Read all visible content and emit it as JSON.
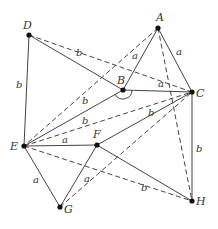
{
  "diagram": {
    "type": "geometry-figure",
    "colors": {
      "line": "#444444",
      "point": "#111111",
      "text": "#333333",
      "background": "#ffffff"
    },
    "points": [
      {
        "id": "A",
        "x": 158,
        "y": 28,
        "label": "A",
        "lx": 156,
        "ly": 21
      },
      {
        "id": "B",
        "x": 123,
        "y": 90,
        "label": "B",
        "lx": 117,
        "ly": 84
      },
      {
        "id": "C",
        "x": 192,
        "y": 92,
        "label": "C",
        "lx": 196,
        "ly": 97
      },
      {
        "id": "D",
        "x": 29,
        "y": 35,
        "label": "D",
        "lx": 23,
        "ly": 29
      },
      {
        "id": "E",
        "x": 24,
        "y": 146,
        "label": "E",
        "lx": 10,
        "ly": 150
      },
      {
        "id": "F",
        "x": 97,
        "y": 145,
        "label": "F",
        "lx": 93,
        "ly": 138
      },
      {
        "id": "G",
        "x": 60,
        "y": 207,
        "label": "G",
        "lx": 64,
        "ly": 213
      },
      {
        "id": "H",
        "x": 192,
        "y": 201,
        "label": "H",
        "lx": 196,
        "ly": 205
      }
    ],
    "edges": [
      {
        "from": "D",
        "to": "E",
        "style": "solid",
        "label": "b",
        "lx": 16,
        "ly": 88
      },
      {
        "from": "D",
        "to": "B",
        "style": "solid",
        "label": "",
        "lx": 0,
        "ly": 0
      },
      {
        "from": "D",
        "to": "C",
        "style": "dashed",
        "label": "b",
        "lx": 76,
        "ly": 56
      },
      {
        "from": "A",
        "to": "B",
        "style": "solid",
        "label": "a",
        "lx": 132,
        "ly": 59
      },
      {
        "from": "A",
        "to": "C",
        "style": "solid",
        "label": "a",
        "lx": 176,
        "ly": 55
      },
      {
        "from": "A",
        "to": "E",
        "style": "dashed",
        "label": "b",
        "lx": 82,
        "ly": 104
      },
      {
        "from": "A",
        "to": "H",
        "style": "dashed",
        "label": "",
        "lx": 0,
        "ly": 0
      },
      {
        "from": "B",
        "to": "C",
        "style": "solid",
        "label": "a",
        "lx": 158,
        "ly": 87
      },
      {
        "from": "B",
        "to": "E",
        "style": "solid",
        "label": "b",
        "lx": 82,
        "ly": 124
      },
      {
        "from": "E",
        "to": "C",
        "style": "dashed",
        "label": "b",
        "lx": 148,
        "ly": 116
      },
      {
        "from": "E",
        "to": "F",
        "style": "solid",
        "label": "a",
        "lx": 62,
        "ly": 143
      },
      {
        "from": "E",
        "to": "G",
        "style": "solid",
        "label": "a",
        "lx": 33,
        "ly": 183
      },
      {
        "from": "E",
        "to": "H",
        "style": "dashed",
        "label": "b",
        "lx": 141,
        "ly": 191
      },
      {
        "from": "F",
        "to": "C",
        "style": "solid",
        "label": "",
        "lx": 0,
        "ly": 0
      },
      {
        "from": "F",
        "to": "G",
        "style": "solid",
        "label": "a",
        "lx": 84,
        "ly": 182
      },
      {
        "from": "F",
        "to": "H",
        "style": "solid",
        "label": "",
        "lx": 0,
        "ly": 0
      },
      {
        "from": "G",
        "to": "C",
        "style": "dashed",
        "label": "",
        "lx": 0,
        "ly": 0
      },
      {
        "from": "C",
        "to": "H",
        "style": "solid",
        "label": "b",
        "lx": 196,
        "ly": 152
      }
    ],
    "angle_mark": {
      "at": "B",
      "from": "E",
      "to": "C",
      "radius": 9
    }
  }
}
